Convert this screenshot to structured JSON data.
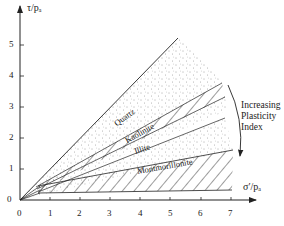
{
  "diagram": {
    "y_axis_label": "τ/pₐ",
    "x_axis_label": "σ′/pₐ",
    "x_ticks": [
      "0",
      "1",
      "2",
      "3",
      "4",
      "5",
      "6",
      "7"
    ],
    "y_ticks": [
      "0",
      "1",
      "2",
      "3",
      "4",
      "5"
    ],
    "regions": {
      "quartz": "Quartz",
      "kaolinite": "Kaolinite",
      "illite": "Illite",
      "montmorillonite": "Montmorillonite"
    },
    "trend_annotation": [
      "Increasing",
      "Plasticity",
      "Index"
    ],
    "colors": {
      "ink": "#222222",
      "background": "#ffffff"
    }
  }
}
